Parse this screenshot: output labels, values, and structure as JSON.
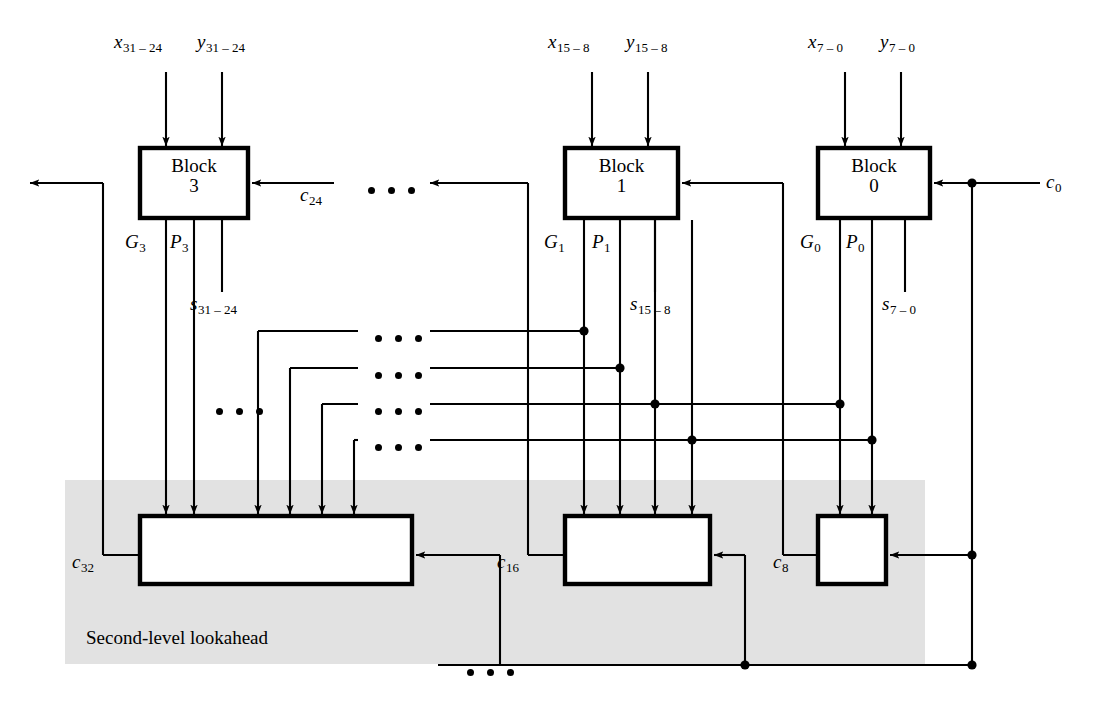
{
  "figure": {
    "shaded_region_label": "Second-level lookahead",
    "shaded_color": "#e2e2e2",
    "line_color": "#000000",
    "background": "#ffffff"
  },
  "blocks": [
    {
      "id": "block3",
      "name": "Block",
      "index": "3",
      "inputs": {
        "x": "x",
        "x_sub": "31 – 24",
        "y": "y",
        "y_sub": "31 – 24",
        "carry": "c",
        "carry_sub": "24"
      },
      "outputs": {
        "g": "G",
        "g_sub": "3",
        "p": "P",
        "p_sub": "3",
        "sum": "s",
        "sum_sub": "31 – 24"
      }
    },
    {
      "id": "block1",
      "name": "Block",
      "index": "1",
      "inputs": {
        "x": "x",
        "x_sub": "15 – 8",
        "y": "y",
        "y_sub": "15 – 8",
        "carry": "",
        "carry_sub": ""
      },
      "outputs": {
        "g": "G",
        "g_sub": "1",
        "p": "P",
        "p_sub": "1",
        "sum": "s",
        "sum_sub": "15 – 8"
      }
    },
    {
      "id": "block0",
      "name": "Block",
      "index": "0",
      "inputs": {
        "x": "x",
        "x_sub": "7 – 0",
        "y": "y",
        "y_sub": "7 – 0",
        "carry": "c",
        "carry_sub": "0"
      },
      "outputs": {
        "g": "G",
        "g_sub": "0",
        "p": "P",
        "p_sub": "0",
        "sum": "s",
        "sum_sub": "7 – 0"
      }
    }
  ],
  "carries": {
    "c0": {
      "sym": "c",
      "sub": "0"
    },
    "c8": {
      "sym": "c",
      "sub": "8"
    },
    "c16": {
      "sym": "c",
      "sub": "16"
    },
    "c24": {
      "sym": "c",
      "sub": "24"
    },
    "c32": {
      "sym": "c",
      "sub": "32"
    }
  },
  "lookahead_boxes": [
    {
      "id": "lookahead-left",
      "carry_out": "c32"
    },
    {
      "id": "lookahead-middle",
      "carry_out": "c16"
    },
    {
      "id": "lookahead-right",
      "carry_out": "c8"
    }
  ],
  "ellipses": [
    {
      "id": "ellipsis-top-row",
      "dots": 3
    },
    {
      "id": "ellipsis-left-column",
      "dots": 3
    },
    {
      "id": "ellipsis-bus-1",
      "dots": 3
    },
    {
      "id": "ellipsis-bus-2",
      "dots": 3
    },
    {
      "id": "ellipsis-bus-3",
      "dots": 3
    },
    {
      "id": "ellipsis-bus-4",
      "dots": 3
    },
    {
      "id": "ellipsis-bottom-wire",
      "dots": 3
    }
  ]
}
